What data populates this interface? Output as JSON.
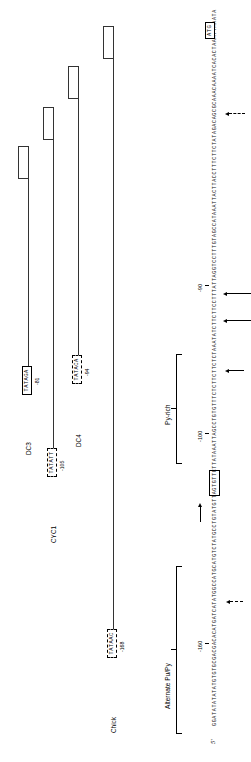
{
  "figure": {
    "five_prime_label": "5'",
    "sequence": "GGATATATATATGTGTGCGACGACACATGATCATATGGCCATGCATGTCTATGCCTGTATGTTAGTGTTCTTATAAATTAGCCTGTGTTTCTCTTCTTCTCTAAATATCTTCTTCCTTTATTAGGTCCTTTGTAGCCATAAATTACTTACCTTTCTTCTATAGACAGCGCAAACAAAATCACACTAAATTAAATA",
    "atg_codon": "ATG",
    "tata_element_boxed": "ATAAA",
    "ticks": [
      {
        "label": "-160"
      },
      {
        "label": "-100"
      },
      {
        "label": "-90"
      }
    ],
    "brackets": [
      {
        "label": "Alternate Pu/Py"
      },
      {
        "label": "Py-rich"
      }
    ],
    "comparisons": [
      {
        "name": "Chick",
        "motif": "TATAAC",
        "position": "-168",
        "box_style": "dashed"
      },
      {
        "name": "CYC1",
        "motif": "TATACA",
        "position": "-94",
        "box_style": "dashed"
      },
      {
        "name": "DC4",
        "motif": "TATATT",
        "position": "-105",
        "box_style": "dashed"
      },
      {
        "name": "DC3",
        "motif": "TATAGA",
        "position": "-81",
        "box_style": "solid"
      }
    ]
  }
}
